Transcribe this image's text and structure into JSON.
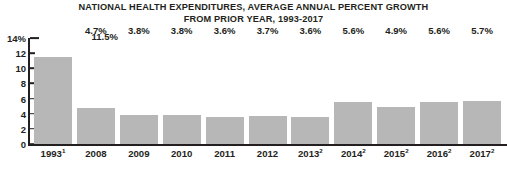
{
  "chart_data": {
    "type": "bar",
    "title": "NATIONAL HEALTH EXPENDITURES, AVERAGE ANNUAL PERCENT GROWTH FROM PRIOR YEAR, 1993-2017",
    "title_line1": "NATIONAL HEALTH EXPENDITURES, AVERAGE ANNUAL PERCENT GROWTH",
    "title_line2": "FROM PRIOR YEAR, 1993-2017",
    "xlabel": "",
    "ylabel": "",
    "ylim": [
      0,
      14
    ],
    "grid": false,
    "legend": false,
    "bar_color": "#b7b7b7",
    "axis_color": "#231f20",
    "text_color": "#231f20",
    "categories": [
      "1993",
      "2008",
      "2009",
      "2010",
      "2011",
      "2012",
      "2013",
      "2014",
      "2015",
      "2016",
      "2017"
    ],
    "category_footnotes": [
      "1",
      "",
      "",
      "",
      "",
      "",
      "2",
      "2",
      "2",
      "2",
      "2"
    ],
    "values": [
      11.5,
      4.7,
      3.8,
      3.8,
      3.6,
      3.7,
      3.6,
      5.6,
      4.9,
      5.6,
      5.7
    ],
    "value_labels": [
      "11.5%",
      "4.7%",
      "3.8%",
      "3.8%",
      "3.6%",
      "3.7%",
      "3.6%",
      "5.6%",
      "4.9%",
      "5.6%",
      "5.7%"
    ],
    "y_ticks": [
      14,
      12,
      10,
      8,
      6,
      4,
      2,
      0
    ],
    "y_tick_labels": [
      "14%",
      "12",
      "10",
      "8",
      "6",
      "4",
      "2",
      "0"
    ]
  }
}
